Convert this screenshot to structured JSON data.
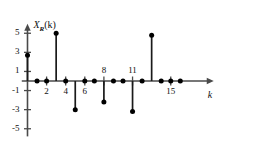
{
  "chart_data": {
    "type": "stem",
    "title": "",
    "xlabel": "k",
    "ylabel": "X_R(k)",
    "ylabel_parts": {
      "main": "X",
      "subscript": "R",
      "argument": "(k)"
    },
    "x": [
      0,
      1,
      2,
      3,
      4,
      5,
      6,
      7,
      8,
      9,
      10,
      11,
      12,
      13,
      14,
      15,
      16
    ],
    "values": [
      2.7,
      0,
      0,
      5.0,
      0,
      -3.0,
      0,
      0,
      -2.2,
      0,
      0,
      -3.2,
      0,
      4.8,
      0,
      0,
      0
    ],
    "xlim": [
      -0.6,
      19.5
    ],
    "ylim": [
      -5.8,
      6.0
    ],
    "xticks": [
      0,
      1,
      2,
      3,
      4,
      5,
      6,
      7,
      8,
      9,
      10,
      11,
      12,
      13,
      14,
      15,
      16
    ],
    "xtick_labels": [
      {
        "x": 2,
        "label": "2"
      },
      {
        "x": 4,
        "label": "4"
      },
      {
        "x": 6,
        "label": "6"
      },
      {
        "x": 8,
        "label": "8"
      },
      {
        "x": 11,
        "label": "11"
      },
      {
        "x": 15,
        "label": "15"
      }
    ],
    "xtick_label_positions": {
      "above": [
        8,
        11
      ],
      "below": [
        2,
        4,
        6,
        15
      ]
    },
    "yticks": [
      -5,
      -3,
      -1,
      1,
      3,
      5
    ],
    "ytick_labels": [
      "-5",
      "-3",
      "-1",
      "1",
      "3",
      "5"
    ],
    "grid": false,
    "legend": null,
    "marker": "filled-circle",
    "line_color": "#1a1a1a",
    "axis_color": "#4a4a4a",
    "marker_color": "#000000"
  },
  "axis_labels": {
    "y5": "5",
    "y3": "3",
    "y1": "1",
    "ym1": "-1",
    "ym3": "-3",
    "ym5": "-5",
    "x2": "2",
    "x4": "4",
    "x6": "6",
    "x8": "8",
    "x11": "11",
    "x15": "15",
    "k": "k",
    "ylabel_main": "X",
    "ylabel_sub": "R",
    "ylabel_arg": "(k)"
  }
}
